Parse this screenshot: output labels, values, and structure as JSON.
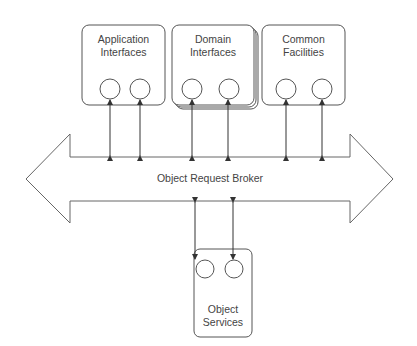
{
  "diagram": {
    "colors": {
      "stroke": "#555555",
      "text": "#444444",
      "background": "#ffffff"
    },
    "nodes": [
      {
        "id": "app",
        "line1": "Application",
        "line2": "Interfaces"
      },
      {
        "id": "domain",
        "line1": "Domain",
        "line2": "Interfaces"
      },
      {
        "id": "common",
        "line1": "Common",
        "line2": "Facilities"
      },
      {
        "id": "services",
        "line1": "Object",
        "line2": "Services"
      }
    ],
    "bus": {
      "label": "Object Request Broker"
    },
    "edges": [
      {
        "from": "app",
        "to": "bus",
        "count": 2,
        "bidirectional": true
      },
      {
        "from": "domain",
        "to": "bus",
        "count": 2,
        "bidirectional": true
      },
      {
        "from": "common",
        "to": "bus",
        "count": 2,
        "bidirectional": true
      },
      {
        "from": "services",
        "to": "bus",
        "count": 2,
        "bidirectional": true
      }
    ]
  }
}
